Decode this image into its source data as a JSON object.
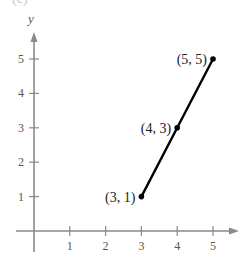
{
  "figure_label": "(c)",
  "chart_data": {
    "type": "line",
    "title": "",
    "xlabel": "",
    "ylabel": "y",
    "x_ticks": [
      "1",
      "2",
      "3",
      "4",
      "5"
    ],
    "y_ticks": [
      "1",
      "2",
      "3",
      "4",
      "5"
    ],
    "xlim": [
      0,
      5.5
    ],
    "ylim": [
      0,
      5.5
    ],
    "grid": false,
    "legend": null,
    "series": [
      {
        "name": "segment",
        "color": "#000000",
        "points": [
          {
            "x": 3,
            "y": 1,
            "label": "(3, 1)"
          },
          {
            "x": 4,
            "y": 3,
            "label": "(4, 3)"
          },
          {
            "x": 5,
            "y": 5,
            "label": "(5, 5)"
          }
        ]
      }
    ],
    "axis_color": "#8a8a8a"
  }
}
